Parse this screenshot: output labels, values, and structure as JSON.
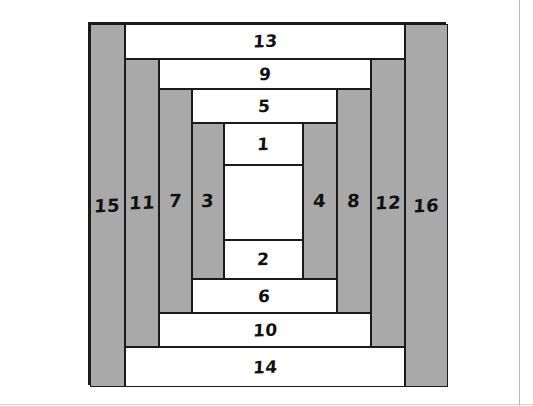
{
  "diagram": {
    "colors": {
      "dark_fabric": "#a9a9a9",
      "light_fabric": "#ffffff",
      "outline": "#1a1a1a"
    },
    "pieces": [
      {
        "label": "1",
        "shade": "light",
        "orientation": "horizontal",
        "x": 222,
        "y": 121,
        "w": 79,
        "h": 42
      },
      {
        "label": "",
        "shade": "light",
        "orientation": "center",
        "x": 222,
        "y": 163,
        "w": 79,
        "h": 75
      },
      {
        "label": "2",
        "shade": "light",
        "orientation": "horizontal",
        "x": 222,
        "y": 238,
        "w": 79,
        "h": 39
      },
      {
        "label": "3",
        "shade": "dark",
        "orientation": "vertical",
        "x": 190,
        "y": 121,
        "w": 32,
        "h": 156
      },
      {
        "label": "4",
        "shade": "dark",
        "orientation": "vertical",
        "x": 301,
        "y": 121,
        "w": 34,
        "h": 156
      },
      {
        "label": "5",
        "shade": "light",
        "orientation": "horizontal",
        "x": 190,
        "y": 87,
        "w": 145,
        "h": 34
      },
      {
        "label": "6",
        "shade": "light",
        "orientation": "horizontal",
        "x": 190,
        "y": 277,
        "w": 145,
        "h": 34
      },
      {
        "label": "7",
        "shade": "dark",
        "orientation": "vertical",
        "x": 157,
        "y": 87,
        "w": 33,
        "h": 224
      },
      {
        "label": "8",
        "shade": "dark",
        "orientation": "vertical",
        "x": 335,
        "y": 87,
        "w": 34,
        "h": 224
      },
      {
        "label": "9",
        "shade": "light",
        "orientation": "horizontal",
        "x": 157,
        "y": 57,
        "w": 212,
        "h": 30
      },
      {
        "label": "10",
        "shade": "light",
        "orientation": "horizontal",
        "x": 157,
        "y": 311,
        "w": 212,
        "h": 34
      },
      {
        "label": "11",
        "shade": "dark",
        "orientation": "vertical",
        "x": 123,
        "y": 57,
        "w": 34,
        "h": 288
      },
      {
        "label": "12",
        "shade": "dark",
        "orientation": "vertical",
        "x": 369,
        "y": 57,
        "w": 34,
        "h": 288
      },
      {
        "label": "13",
        "shade": "light",
        "orientation": "horizontal",
        "x": 123,
        "y": 22,
        "w": 280,
        "h": 35
      },
      {
        "label": "14",
        "shade": "light",
        "orientation": "horizontal",
        "x": 123,
        "y": 345,
        "w": 280,
        "h": 40
      },
      {
        "label": "15",
        "shade": "dark",
        "orientation": "vertical",
        "x": 88,
        "y": 22,
        "w": 35,
        "h": 363
      },
      {
        "label": "16",
        "shade": "dark",
        "orientation": "vertical",
        "x": 403,
        "y": 22,
        "w": 43,
        "h": 363
      }
    ]
  }
}
